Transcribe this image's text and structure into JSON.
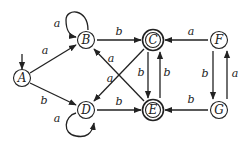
{
  "diagram": {
    "type": "finite-automaton",
    "states": [
      {
        "id": "A",
        "label": "A",
        "x": 22,
        "y": 78,
        "accepting": false,
        "initial": true
      },
      {
        "id": "B",
        "label": "B",
        "x": 86,
        "y": 40,
        "accepting": false,
        "initial": false
      },
      {
        "id": "C",
        "label": "C",
        "x": 153,
        "y": 40,
        "accepting": true,
        "initial": false
      },
      {
        "id": "D",
        "label": "D",
        "x": 86,
        "y": 110,
        "accepting": false,
        "initial": false
      },
      {
        "id": "E",
        "label": "E",
        "x": 153,
        "y": 110,
        "accepting": true,
        "initial": false
      },
      {
        "id": "F",
        "label": "F",
        "x": 219,
        "y": 40,
        "accepting": false,
        "initial": false
      },
      {
        "id": "G",
        "label": "G",
        "x": 219,
        "y": 110,
        "accepting": false,
        "initial": false
      }
    ],
    "transitions": [
      {
        "from": "A",
        "to": "B",
        "label": "a"
      },
      {
        "from": "A",
        "to": "D",
        "label": "b"
      },
      {
        "from": "B",
        "to": "B",
        "label": "a"
      },
      {
        "from": "B",
        "to": "C",
        "label": "b"
      },
      {
        "from": "C",
        "to": "D",
        "label": "a"
      },
      {
        "from": "C",
        "to": "E",
        "label": "b"
      },
      {
        "from": "D",
        "to": "D",
        "label": "a"
      },
      {
        "from": "D",
        "to": "E",
        "label": "b"
      },
      {
        "from": "E",
        "to": "B",
        "label": "a"
      },
      {
        "from": "E",
        "to": "C",
        "label": "b"
      },
      {
        "from": "F",
        "to": "C",
        "label": "a"
      },
      {
        "from": "F",
        "to": "G",
        "label": "b"
      },
      {
        "from": "G",
        "to": "E",
        "label": "b"
      },
      {
        "from": "G",
        "to": "F",
        "label": "a"
      }
    ],
    "labels": {
      "A": "A",
      "B": "B",
      "C": "C",
      "D": "D",
      "E": "E",
      "F": "F",
      "G": "G",
      "a": "a",
      "b": "b"
    }
  }
}
